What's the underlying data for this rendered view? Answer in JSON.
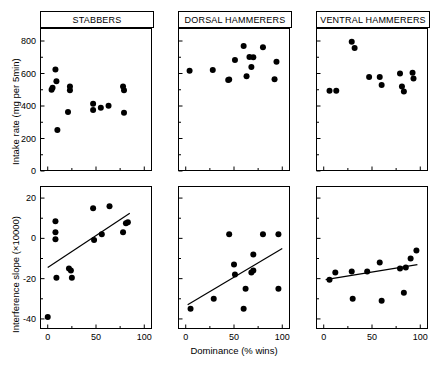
{
  "figure": {
    "xlabel": "Dominance (% wins)",
    "ylabel_top": "Intake rate (mg per 5min)",
    "ylabel_bottom": "Interference slope (×10000)"
  },
  "panels": {
    "col_titles": [
      "STABBERS",
      "DORSAL HAMMERERS",
      "VENTRAL HAMMERERS"
    ]
  },
  "axes": {
    "x_ticks_major": [
      "0",
      "50",
      "100"
    ],
    "x_major_values": [
      0,
      50,
      100
    ],
    "x_minor_values": [
      25,
      75
    ],
    "x_range": [
      -8,
      108
    ],
    "y_top_ticks": [
      "0",
      "200",
      "400",
      "600",
      "800"
    ],
    "y_top_values": [
      0,
      200,
      400,
      600,
      800
    ],
    "y_top_range": [
      0,
      880
    ],
    "y_bottom_ticks": [
      "20",
      "0",
      "-20",
      "-40"
    ],
    "y_bottom_values": [
      20,
      0,
      -20,
      -40
    ],
    "y_bottom_minor": [
      10,
      -10,
      -30
    ],
    "y_bottom_range": [
      -45,
      26
    ]
  },
  "chart_data": {
    "type": "scatter",
    "title": "",
    "xlabel": "Dominance (% wins)",
    "grid": false,
    "legend": "none",
    "marker": "filled-circle",
    "marker_color": "#000000",
    "panels": [
      {
        "row": "top",
        "col": 0,
        "title": "STABBERS",
        "ylabel": "Intake rate (mg per 5min)",
        "xlim": [
          -8,
          108
        ],
        "ylim": [
          0,
          880
        ],
        "regression_line": null,
        "points": [
          {
            "x": 4,
            "y": 500
          },
          {
            "x": 5,
            "y": 512
          },
          {
            "x": 8,
            "y": 625
          },
          {
            "x": 9,
            "y": 553
          },
          {
            "x": 10,
            "y": 252
          },
          {
            "x": 21,
            "y": 363
          },
          {
            "x": 23,
            "y": 520
          },
          {
            "x": 23,
            "y": 497
          },
          {
            "x": 47,
            "y": 414
          },
          {
            "x": 47,
            "y": 375
          },
          {
            "x": 55,
            "y": 389
          },
          {
            "x": 63,
            "y": 402
          },
          {
            "x": 78,
            "y": 520
          },
          {
            "x": 79,
            "y": 497
          },
          {
            "x": 79,
            "y": 358
          }
        ]
      },
      {
        "row": "top",
        "col": 1,
        "title": "DORSAL HAMMERERS",
        "ylabel": "Intake rate (mg per 5min)",
        "xlim": [
          -8,
          108
        ],
        "ylim": [
          0,
          880
        ],
        "regression_line": null,
        "points": [
          {
            "x": 4,
            "y": 617
          },
          {
            "x": 28,
            "y": 622
          },
          {
            "x": 44,
            "y": 560
          },
          {
            "x": 45,
            "y": 563
          },
          {
            "x": 51,
            "y": 683
          },
          {
            "x": 60,
            "y": 770
          },
          {
            "x": 66,
            "y": 702
          },
          {
            "x": 70,
            "y": 700
          },
          {
            "x": 68,
            "y": 640
          },
          {
            "x": 63,
            "y": 583
          },
          {
            "x": 80,
            "y": 762
          },
          {
            "x": 94,
            "y": 672
          },
          {
            "x": 92,
            "y": 565
          }
        ]
      },
      {
        "row": "top",
        "col": 2,
        "title": "VENTRAL HAMMERERS",
        "ylabel": "Intake rate (mg per 5min)",
        "xlim": [
          -8,
          108
        ],
        "ylim": [
          0,
          880
        ],
        "regression_line": null,
        "points": [
          {
            "x": 6,
            "y": 494
          },
          {
            "x": 13,
            "y": 494
          },
          {
            "x": 29,
            "y": 795
          },
          {
            "x": 32,
            "y": 757
          },
          {
            "x": 47,
            "y": 578
          },
          {
            "x": 58,
            "y": 578
          },
          {
            "x": 60,
            "y": 530
          },
          {
            "x": 79,
            "y": 600
          },
          {
            "x": 81,
            "y": 520
          },
          {
            "x": 83,
            "y": 490
          },
          {
            "x": 92,
            "y": 605
          },
          {
            "x": 93,
            "y": 570
          }
        ]
      },
      {
        "row": "bottom",
        "col": 0,
        "title": "STABBERS",
        "ylabel": "Interference slope (×10000)",
        "xlim": [
          -8,
          108
        ],
        "ylim": [
          -45,
          26
        ],
        "regression_line": {
          "x1": 0,
          "y1": -14.5,
          "x2": 85,
          "y2": 12.5
        },
        "points": [
          {
            "x": 0,
            "y": -39
          },
          {
            "x": 8,
            "y": 8.5
          },
          {
            "x": 8,
            "y": 3
          },
          {
            "x": 8,
            "y": -0.5
          },
          {
            "x": 9,
            "y": -19.5
          },
          {
            "x": 22,
            "y": -15
          },
          {
            "x": 24,
            "y": -16
          },
          {
            "x": 25,
            "y": -19.5
          },
          {
            "x": 47,
            "y": 15
          },
          {
            "x": 48,
            "y": -0.8
          },
          {
            "x": 56,
            "y": 2
          },
          {
            "x": 64,
            "y": 16
          },
          {
            "x": 78,
            "y": 3
          },
          {
            "x": 81,
            "y": 7.5
          },
          {
            "x": 83,
            "y": 8
          }
        ]
      },
      {
        "row": "bottom",
        "col": 1,
        "title": "DORSAL HAMMERERS",
        "ylabel": "Interference slope (×10000)",
        "xlim": [
          -8,
          108
        ],
        "ylim": [
          -45,
          26
        ],
        "regression_line": {
          "x1": 2,
          "y1": -33,
          "x2": 100,
          "y2": -5
        },
        "points": [
          {
            "x": 5,
            "y": -35
          },
          {
            "x": 29,
            "y": -30
          },
          {
            "x": 45,
            "y": 2
          },
          {
            "x": 50,
            "y": -13
          },
          {
            "x": 51,
            "y": -18
          },
          {
            "x": 60,
            "y": -35
          },
          {
            "x": 62,
            "y": -25
          },
          {
            "x": 68,
            "y": -17
          },
          {
            "x": 70,
            "y": -16
          },
          {
            "x": 70,
            "y": -8
          },
          {
            "x": 80,
            "y": 2
          },
          {
            "x": 96,
            "y": 2
          },
          {
            "x": 96,
            "y": -25
          }
        ]
      },
      {
        "row": "bottom",
        "col": 2,
        "title": "VENTRAL HAMMERERS",
        "ylabel": "Interference slope (×10000)",
        "xlim": [
          -8,
          108
        ],
        "ylim": [
          -45,
          26
        ],
        "regression_line": {
          "x1": 2,
          "y1": -20.5,
          "x2": 97,
          "y2": -13
        },
        "points": [
          {
            "x": 6,
            "y": -20.5
          },
          {
            "x": 12,
            "y": -17
          },
          {
            "x": 29,
            "y": -16.5
          },
          {
            "x": 30,
            "y": -30
          },
          {
            "x": 45,
            "y": -16.5
          },
          {
            "x": 58,
            "y": -12
          },
          {
            "x": 60,
            "y": -31
          },
          {
            "x": 79,
            "y": -15
          },
          {
            "x": 83,
            "y": -27
          },
          {
            "x": 85,
            "y": -14.5
          },
          {
            "x": 90,
            "y": -10
          },
          {
            "x": 96,
            "y": -6
          }
        ]
      }
    ]
  }
}
